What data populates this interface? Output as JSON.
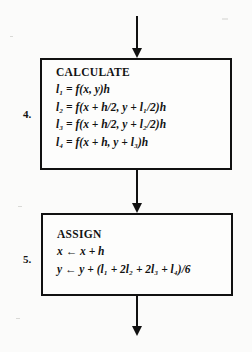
{
  "diagram": {
    "type": "flowchart",
    "steps": [
      {
        "number": "4.",
        "title": "CALCULATE",
        "lines": [
          {
            "lhs": "l",
            "lhs_sub": "1",
            "rel": "=",
            "rhs": "f(x, y)h"
          },
          {
            "lhs": "l",
            "lhs_sub": "2",
            "rel": "=",
            "rhs": "f(x + h/2, y + l₁/2)h"
          },
          {
            "lhs": "l",
            "lhs_sub": "3",
            "rel": "=",
            "rhs": "f(x + h/2, y + l₂/2)h"
          },
          {
            "lhs": "l",
            "lhs_sub": "4",
            "rel": "=",
            "rhs": "f(x + h, y + l₃)h"
          }
        ]
      },
      {
        "number": "5.",
        "title": "ASSIGN",
        "lines": [
          {
            "lhs": "x",
            "lhs_sub": "",
            "rel": "←",
            "rhs": "x + h"
          },
          {
            "lhs": "y",
            "lhs_sub": "",
            "rel": "←",
            "rhs": "y + (l₁ + 2l₂ + 2l₃ + l₄)/6"
          }
        ]
      }
    ],
    "equation_text": {
      "calc_1": "l₁ = f(x, y)h",
      "calc_2": "l₂ = f(x + h/2, y + l₁/2)h",
      "calc_3": "l₃ = f(x + h/2, y + l₂/2)h",
      "calc_4": "l₄ = f(x + h, y + l₃)h",
      "assign_1": "x ← x + h",
      "assign_2": "y ← y + (l₁ + 2l₂ + 2l₃ + l₄)/6"
    },
    "connectors": [
      {
        "name": "inflow-arrow",
        "label": ""
      },
      {
        "name": "calculate-to-assign-arrow",
        "label": ""
      },
      {
        "name": "outflow-arrow",
        "label": ""
      }
    ],
    "colors": {
      "ink": "#111111",
      "paper": "#fbfbfa",
      "box_fill": "#fdfdfc"
    }
  }
}
